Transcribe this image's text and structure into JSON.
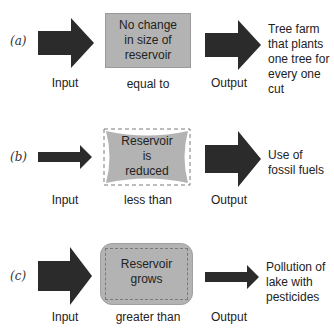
{
  "colors": {
    "arrow": "#2b2b2b",
    "reservoir_fill": "#b3b3b3",
    "reservoir_border": "#8a8a8a",
    "dashed": "#7a7a7a"
  },
  "rows": [
    {
      "tag": "(a)",
      "reservoir_lines": [
        "No change",
        "in size of",
        "reservoir"
      ],
      "relation": "equal to",
      "input_label": "Input",
      "output_label": "Output",
      "example_lines": [
        "Tree farm",
        "that plants",
        "one tree for",
        "every one cut"
      ],
      "input_size": "large",
      "output_size": "large"
    },
    {
      "tag": "(b)",
      "reservoir_lines": [
        "Reservoir",
        "is",
        "reduced"
      ],
      "relation": "less than",
      "input_label": "Input",
      "output_label": "Output",
      "example_lines": [
        "Use of",
        "fossil fuels"
      ],
      "input_size": "small",
      "output_size": "large"
    },
    {
      "tag": "(c)",
      "reservoir_lines": [
        "Reservoir",
        "grows"
      ],
      "relation": "greater than",
      "input_label": "Input",
      "output_label": "Output",
      "example_lines": [
        "Pollution of",
        "lake with",
        "pesticides"
      ],
      "input_size": "large",
      "output_size": "small"
    }
  ]
}
